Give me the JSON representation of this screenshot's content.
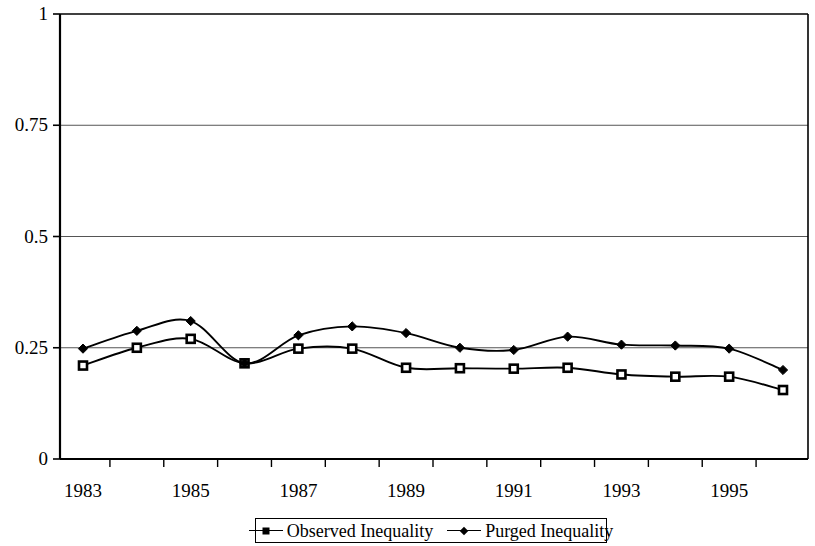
{
  "chart_data": {
    "type": "line",
    "title": "",
    "subtitle": "",
    "xlabel": "",
    "ylabel": "",
    "x": [
      1983,
      1984,
      1985,
      1986,
      1987,
      1988,
      1989,
      1990,
      1991,
      1992,
      1993,
      1994,
      1995,
      1996
    ],
    "categories": [
      "1983",
      "1984",
      "1985",
      "1986",
      "1987",
      "1988",
      "1989",
      "1990",
      "1991",
      "1992",
      "1993",
      "1994",
      "1995",
      "1996"
    ],
    "series": [
      {
        "name": "Observed Inequality",
        "marker": "square",
        "color": "#000000",
        "values": [
          0.21,
          0.25,
          0.27,
          0.215,
          0.248,
          0.248,
          0.205,
          0.204,
          0.203,
          0.205,
          0.19,
          0.185,
          0.185,
          0.155
        ]
      },
      {
        "name": "Purged Inequality",
        "marker": "diamond",
        "color": "#000000",
        "values": [
          0.248,
          0.288,
          0.31,
          0.215,
          0.278,
          0.298,
          0.283,
          0.25,
          0.245,
          0.275,
          0.257,
          0.255,
          0.248,
          0.2
        ]
      }
    ],
    "ylim": [
      0,
      1
    ],
    "yticks": [
      0,
      0.25,
      0.5,
      0.75,
      1
    ],
    "ytick_labels": [
      "0",
      "0.25",
      "0.5",
      "0.75",
      "1"
    ],
    "xlim": [
      1983,
      1996
    ],
    "xtick_labels": [
      "1983",
      "1985",
      "1987",
      "1989",
      "1991",
      "1993",
      "1995"
    ],
    "xtick_values": [
      1983,
      1985,
      1987,
      1989,
      1991,
      1993,
      1995
    ],
    "grid": "horizontal",
    "legend_position": "bottom-center",
    "legend_entries": [
      "Observed Inequality",
      "Purged Inequality"
    ]
  }
}
